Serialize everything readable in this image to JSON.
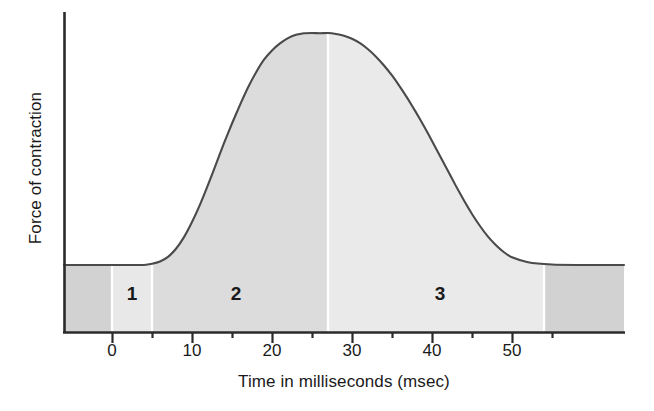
{
  "chart_data": {
    "type": "area",
    "title": "",
    "xlabel": "Time in milliseconds (msec)",
    "ylabel": "Force of contraction",
    "xlim": [
      -6,
      64
    ],
    "ylim": [
      0,
      1.08
    ],
    "grid": false,
    "legend": "none",
    "x_major_ticks": [
      0,
      10,
      20,
      30,
      40,
      50
    ],
    "x_minor_ticks": [
      5,
      15,
      25,
      35,
      45,
      55
    ],
    "x_tick_labels": [
      "0",
      "10",
      "20",
      "30",
      "40",
      "50"
    ],
    "y_tick_labels": [],
    "series": [
      {
        "name": "Force of contraction",
        "x": [
          -6,
          -2,
          0,
          2,
          4,
          5,
          6,
          7,
          8,
          9,
          10,
          11,
          12,
          13,
          14,
          15,
          16,
          17,
          18,
          19,
          20,
          21,
          22,
          23,
          24,
          25,
          26,
          27,
          28,
          29,
          30,
          31,
          32,
          33,
          34,
          35,
          36,
          37,
          38,
          39,
          40,
          41,
          42,
          43,
          44,
          45,
          46,
          47,
          48,
          49,
          50,
          52,
          55,
          58,
          62,
          64
        ],
        "y": [
          0.0,
          0.0,
          0.0,
          0.0,
          0.0,
          0.005,
          0.015,
          0.035,
          0.07,
          0.12,
          0.185,
          0.26,
          0.345,
          0.435,
          0.525,
          0.61,
          0.69,
          0.765,
          0.83,
          0.885,
          0.925,
          0.955,
          0.978,
          0.992,
          0.999,
          1.0,
          0.999,
          1.0,
          0.996,
          0.988,
          0.975,
          0.956,
          0.93,
          0.898,
          0.86,
          0.817,
          0.768,
          0.715,
          0.658,
          0.598,
          0.535,
          0.47,
          0.405,
          0.34,
          0.278,
          0.22,
          0.168,
          0.122,
          0.085,
          0.055,
          0.033,
          0.012,
          0.002,
          0.0,
          0.0,
          0.0
        ]
      }
    ],
    "annotations": [
      {
        "id": "phase-1",
        "label": "1",
        "x_start": 0,
        "x_end": 5,
        "x_center": 2.5,
        "shade": "light"
      },
      {
        "id": "phase-2",
        "label": "2",
        "x_start": 5,
        "x_end": 27,
        "x_center": 15.5,
        "shade": "medium"
      },
      {
        "id": "phase-3",
        "label": "3",
        "x_start": 27,
        "x_end": 54,
        "x_center": 41,
        "shade": "lightest"
      }
    ],
    "colors": {
      "axis": "#2b2b2b",
      "curve": "#4a4a4a",
      "shade_outer": "#d2d2d2",
      "shade_phase1": "#e8e8e8",
      "shade_phase2": "#dcdcdc",
      "shade_phase3": "#eaeaea",
      "text": "#1a1a1a",
      "divider": "#ffffff",
      "background": "#ffffff"
    }
  }
}
